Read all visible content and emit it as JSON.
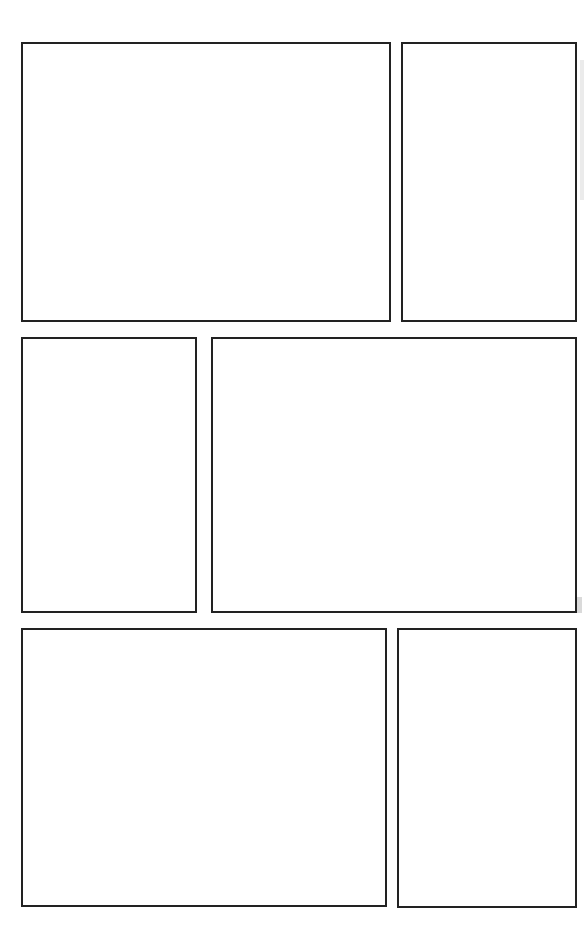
{
  "page": {
    "background_color": "#ffffff",
    "border_color": "#222222",
    "width": 584,
    "height": 941,
    "panel_count": 6,
    "row_count": 3
  },
  "layout": {
    "rows": [
      {
        "name": "row-1",
        "panels": [
          {
            "id": "panel-1",
            "position": "left",
            "shape": "wide-landscape",
            "x": 21,
            "y": 42,
            "width": 370,
            "height": 280,
            "content": ""
          },
          {
            "id": "panel-2",
            "position": "right",
            "shape": "narrow-portrait",
            "x": 401,
            "y": 42,
            "width": 176,
            "height": 280,
            "content": ""
          }
        ]
      },
      {
        "name": "row-2",
        "panels": [
          {
            "id": "panel-3",
            "position": "left",
            "shape": "narrow-portrait",
            "x": 21,
            "y": 337,
            "width": 176,
            "height": 276,
            "content": ""
          },
          {
            "id": "panel-4",
            "position": "right",
            "shape": "wide-landscape",
            "x": 211,
            "y": 337,
            "width": 366,
            "height": 276,
            "content": ""
          }
        ]
      },
      {
        "name": "row-3",
        "panels": [
          {
            "id": "panel-5",
            "position": "left",
            "shape": "wide-landscape",
            "x": 21,
            "y": 628,
            "width": 366,
            "height": 279,
            "content": ""
          },
          {
            "id": "panel-6",
            "position": "right",
            "shape": "narrow-portrait",
            "x": 397,
            "y": 628,
            "width": 180,
            "height": 280,
            "content": ""
          }
        ]
      }
    ]
  },
  "artifacts": [
    {
      "name": "scan-smudge-right-margin",
      "x": 577,
      "y": 597,
      "width": 5,
      "height": 16,
      "color": "#bdbdbd"
    },
    {
      "name": "scan-smudge-right-edge",
      "x": 580,
      "y": 60,
      "width": 4,
      "height": 140,
      "color": "#d8d8d8"
    }
  ]
}
